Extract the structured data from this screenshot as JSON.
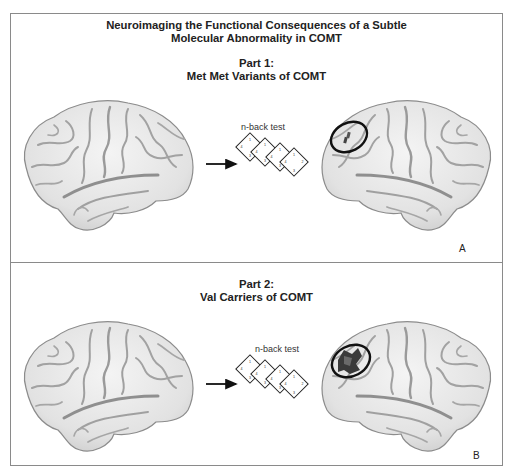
{
  "figure": {
    "title_line1": "Neuroimaging the Functional Consequences of a Subtle",
    "title_line2": "Molecular Abnormality in COMT"
  },
  "panels": [
    {
      "part_label": "Part 1:",
      "part_title": "Met Met Variants of COMT",
      "task_label": "n-back test",
      "panel_letter": "A",
      "activation": "small"
    },
    {
      "part_label": "Part 2:",
      "part_title": "Val Carriers of COMT",
      "task_label": "n-back test",
      "panel_letter": "B",
      "activation": "large"
    }
  ],
  "diamond_numbers": [
    "1",
    "2",
    "3",
    "4"
  ],
  "colors": {
    "border": "#8a8a8a",
    "brain_fill": "#e6e6e6",
    "brain_outline": "#8c8c8c",
    "sulci": "#9a9a9a",
    "activation": "#3a3a3a",
    "circle": "#111111"
  }
}
